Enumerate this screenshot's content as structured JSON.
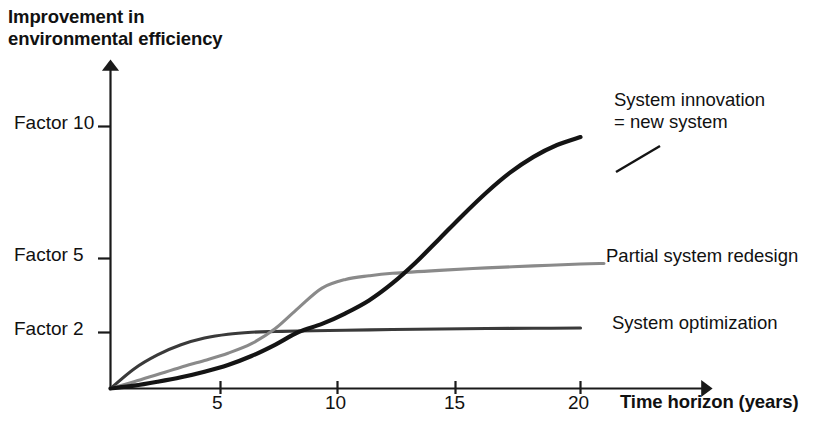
{
  "chart_data": {
    "type": "line",
    "title_line_1": "Improvement in",
    "title_line_2": "environmental efficiency",
    "xlabel": "Time horizon (years)",
    "ylabel": "Improvement in environmental efficiency",
    "grid": false,
    "legend_position": "inline-right-of-curve-ends",
    "xlim": [
      0,
      21
    ],
    "ylim": [
      1,
      11
    ],
    "x_ticks": [
      5,
      10,
      15,
      20
    ],
    "x_tick_labels": [
      "5",
      "10",
      "15",
      "20"
    ],
    "y_ticks": [
      2,
      5,
      10
    ],
    "y_tick_labels": [
      "Factor 2",
      "Factor 5",
      "Factor 10"
    ],
    "axes_style": "arrow-tipped open axes, no box, no gridlines",
    "series": [
      {
        "name": "System optimization",
        "label": "System optimization",
        "color": "#3a3a3a",
        "stroke_width": 3.1,
        "x": [
          0,
          1,
          2,
          3,
          4,
          5,
          6,
          7,
          8,
          10,
          12,
          14,
          16,
          18,
          20
        ],
        "values": [
          1.0,
          1.35,
          1.6,
          1.78,
          1.9,
          1.97,
          2.01,
          2.04,
          2.06,
          2.09,
          2.12,
          2.14,
          2.16,
          2.17,
          2.18
        ]
      },
      {
        "name": "Partial system redesign",
        "label": "Partial system redesign",
        "color": "#8a8a8a",
        "stroke_width": 3.1,
        "x": [
          0,
          1,
          2,
          3,
          4,
          5,
          6,
          7,
          8,
          9,
          10,
          11,
          12,
          14,
          16,
          18,
          20,
          21
        ],
        "values": [
          1.0,
          1.12,
          1.25,
          1.38,
          1.5,
          1.63,
          1.8,
          2.15,
          3.0,
          3.8,
          4.15,
          4.3,
          4.4,
          4.52,
          4.62,
          4.7,
          4.78,
          4.8
        ]
      },
      {
        "name": "System innovation = new system",
        "label_line_1": "System innovation",
        "label_line_2": "= new system",
        "label": "System innovation = new system",
        "color": "#141414",
        "stroke_width": 4.2,
        "x": [
          0,
          1,
          2,
          3,
          4,
          5,
          6,
          7,
          8,
          9,
          10,
          11,
          12,
          13,
          14,
          15,
          16,
          17,
          18,
          19,
          20
        ],
        "values": [
          1.0,
          1.05,
          1.12,
          1.2,
          1.3,
          1.42,
          1.58,
          1.78,
          2.02,
          2.35,
          2.78,
          3.3,
          4.0,
          4.85,
          5.75,
          6.65,
          7.5,
          8.25,
          8.85,
          9.3,
          9.6
        ]
      }
    ],
    "crossings": [
      {
        "between": [
          "System optimization",
          "Partial system redesign"
        ],
        "x": 7.2,
        "y": 2.03
      },
      {
        "between": [
          "System innovation = new system",
          "System optimization"
        ],
        "x": 11.4,
        "y": 2.12
      },
      {
        "between": [
          "System innovation = new system",
          "Partial system redesign"
        ],
        "x": 14.8,
        "y": 4.57
      }
    ]
  },
  "colors": {
    "background": "#ffffff",
    "axis": "#1a1a1a",
    "text": "#111111",
    "series_optimization": "#3a3a3a",
    "series_redesign": "#8a8a8a",
    "series_innovation": "#141414"
  }
}
